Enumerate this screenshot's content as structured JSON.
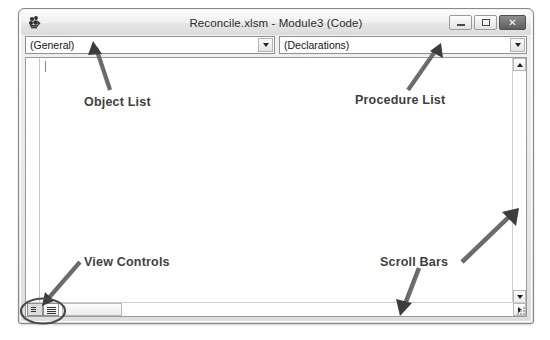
{
  "window": {
    "title": "Reconcile.xlsm - Module3 (Code)",
    "icon": "vba-module-icon",
    "controls": [
      {
        "name": "minimize-button",
        "glyph": "minimize-icon",
        "label": ""
      },
      {
        "name": "maximize-button",
        "glyph": "maximize-icon",
        "label": ""
      },
      {
        "name": "close-button",
        "glyph": "close-icon",
        "label": "✕"
      }
    ]
  },
  "toolbar": {
    "object_list": {
      "name": "object-list-dropdown",
      "value": "(General)",
      "arrow_icon": "chevron-down-icon"
    },
    "procedure_list": {
      "name": "procedure-list-dropdown",
      "value": "(Declarations)",
      "arrow_icon": "chevron-down-icon"
    }
  },
  "code_pane": {
    "content": "",
    "caret_visible": true,
    "vertical_scrollbar": {
      "up_icon": "triangle-up-icon",
      "down_icon": "triangle-down-icon"
    },
    "horizontal_scrollbar": {
      "right_icon": "triangle-right-icon"
    },
    "view_controls": [
      {
        "name": "procedure-view-button",
        "icon": "procedure-view-icon",
        "state": "pressed"
      },
      {
        "name": "full-module-view-button",
        "icon": "full-module-view-icon",
        "state": "normal"
      }
    ]
  },
  "annotations": {
    "object_list": "Object List",
    "procedure_list": "Procedure List",
    "view_controls": "View Controls",
    "scroll_bars": "Scroll Bars"
  },
  "colors": {
    "frame": "#8a8a8a",
    "titlebar_text": "#2b2b2b",
    "annotation_text": "#3f3f3f",
    "arrow": "#5a5a5a",
    "pane_background": "#ffffff"
  }
}
